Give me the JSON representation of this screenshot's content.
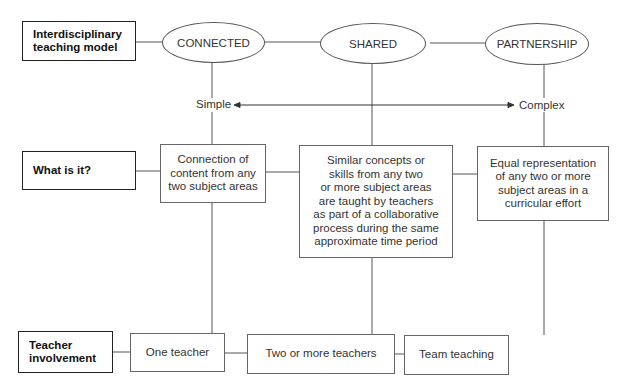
{
  "row_labels": {
    "model": "Interdisciplinary\nteaching model",
    "what": "What is it?",
    "teacher": "Teacher\ninvolvement"
  },
  "models": [
    {
      "name": "CONNECTED",
      "description": "Connection of\ncontent from any\ntwo subject areas",
      "teacher_involvement": "One teacher"
    },
    {
      "name": "SHARED",
      "description": "Similar concepts or\nskills from any two\nor more subject areas\nare taught by teachers\nas part of a collaborative\nprocess during the same\napproximate time period",
      "teacher_involvement": "Two or more teachers"
    },
    {
      "name": "PARTNERSHIP",
      "description": "Equal representation\nof any two or more\nsubject areas in a\ncurricular effort",
      "teacher_involvement": "Team teaching"
    }
  ],
  "scale": {
    "left_label": "Simple",
    "right_label": "Complex",
    "arrow": "double-headed-arrow"
  },
  "colors": {
    "line": "#555555",
    "label_border": "#222222",
    "background": "#ffffff"
  }
}
